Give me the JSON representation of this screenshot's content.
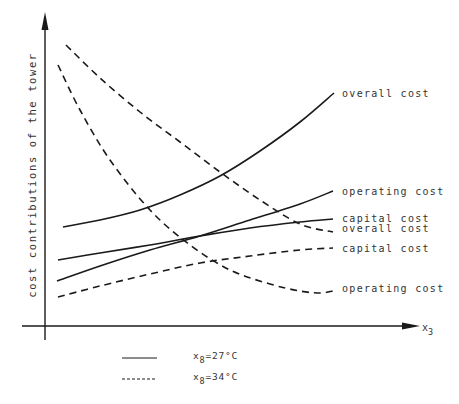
{
  "colors": {
    "background": "#ffffff",
    "ink": "#1a1a1a",
    "text": "#333333"
  },
  "chart_data": {
    "type": "line",
    "title": "",
    "xlabel": "x3",
    "ylabel": "cost contributions of the tower",
    "grid": false,
    "legend_position": "bottom",
    "axis_ticks": "none (qualitative sketch, no numeric scale)",
    "legend": [
      {
        "style": "solid",
        "label": "x8=27°C",
        "var": "x",
        "sub": "8",
        "value": "=27°C"
      },
      {
        "style": "dashed",
        "label": "x8=34°C",
        "var": "x",
        "sub": "8",
        "value": "=34°C"
      }
    ],
    "series": [
      {
        "name": "overall cost",
        "condition": "x8=27°C",
        "style": "solid",
        "label_pos": [
          340,
          97
        ],
        "points": [
          [
            63,
            227
          ],
          [
            100,
            220
          ],
          [
            140,
            210
          ],
          [
            180,
            195
          ],
          [
            220,
            176
          ],
          [
            260,
            151
          ],
          [
            300,
            122
          ],
          [
            334,
            93
          ]
        ]
      },
      {
        "name": "operating cost",
        "condition": "x8=27°C",
        "style": "solid",
        "label_pos": [
          342,
          195
        ],
        "points": [
          [
            57,
            281
          ],
          [
            100,
            266
          ],
          [
            150,
            250
          ],
          [
            200,
            236
          ],
          [
            250,
            220
          ],
          [
            300,
            204
          ],
          [
            333,
            191
          ]
        ]
      },
      {
        "name": "capital cost",
        "condition": "x8=27°C",
        "style": "solid",
        "label_pos": [
          342,
          221
        ],
        "points": [
          [
            58,
            260
          ],
          [
            100,
            253
          ],
          [
            150,
            245
          ],
          [
            200,
            236
          ],
          [
            250,
            228
          ],
          [
            300,
            222
          ],
          [
            333,
            219
          ]
        ]
      },
      {
        "name": "overall cost",
        "condition": "x8=34°C",
        "style": "dashed",
        "label_pos": [
          342,
          232
        ],
        "points": [
          [
            66,
            45
          ],
          [
            100,
            78
          ],
          [
            140,
            112
          ],
          [
            180,
            142
          ],
          [
            220,
            172
          ],
          [
            260,
            200
          ],
          [
            300,
            224
          ],
          [
            333,
            232
          ]
        ]
      },
      {
        "name": "capital cost",
        "condition": "x8=34°C",
        "style": "dashed",
        "label_pos": [
          342,
          250
        ],
        "points": [
          [
            58,
            297
          ],
          [
            100,
            286
          ],
          [
            150,
            274
          ],
          [
            200,
            263
          ],
          [
            250,
            256
          ],
          [
            300,
            250
          ],
          [
            333,
            248
          ]
        ]
      },
      {
        "name": "operating cost",
        "condition": "x8=34°C",
        "style": "dashed",
        "label_pos": [
          342,
          290
        ],
        "points": [
          [
            58,
            65
          ],
          [
            80,
            110
          ],
          [
            110,
            160
          ],
          [
            150,
            210
          ],
          [
            190,
            245
          ],
          [
            230,
            270
          ],
          [
            270,
            284
          ],
          [
            300,
            291
          ],
          [
            320,
            293
          ],
          [
            333,
            291
          ]
        ]
      }
    ]
  },
  "axes": {
    "y_axis_label": "cost contributions of the tower",
    "x_axis_var": "x",
    "x_axis_sub": "3"
  },
  "labels": {
    "overall_cost_27": "overall cost",
    "operating_cost_27": "operating cost",
    "capital_cost_27": "capital cost",
    "overall_cost_34": "overall cost",
    "capital_cost_34": "capital cost",
    "operating_cost_34": "operating cost"
  },
  "legend": {
    "solid_var": "x",
    "solid_sub": "8",
    "solid_value": "=27°C",
    "dashed_var": "x",
    "dashed_sub": "8",
    "dashed_value": "=34°C"
  }
}
